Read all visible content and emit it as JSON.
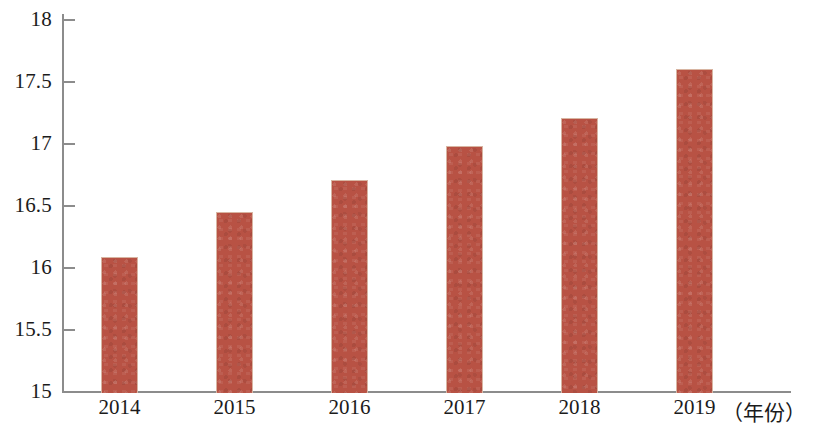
{
  "chart_data": {
    "type": "bar",
    "title": "",
    "subtitle": "",
    "xlabel": "（年份）",
    "ylabel": "",
    "categories": [
      "2014",
      "2015",
      "2016",
      "2017",
      "2018",
      "2019"
    ],
    "values": [
      16.1,
      16.46,
      16.72,
      16.99,
      17.22,
      17.61
    ],
    "series": [
      {
        "name": "",
        "values": [
          16.1,
          16.46,
          16.72,
          16.99,
          17.22,
          17.61
        ]
      }
    ],
    "ylim": [
      15,
      18
    ],
    "xlim_note": "categorical",
    "ytick_labels": [
      "18",
      "17.5",
      "17",
      "16.5",
      "16",
      "15.5",
      "15"
    ],
    "ytick_values": [
      18,
      17.5,
      17,
      16.5,
      16,
      15.5,
      15
    ],
    "grid": false,
    "legend": false,
    "legend_position": "none",
    "annotations": [],
    "bar_color": "#b85244",
    "axis_color": "#8c8c8c",
    "text_color": "#1b1b1b"
  }
}
